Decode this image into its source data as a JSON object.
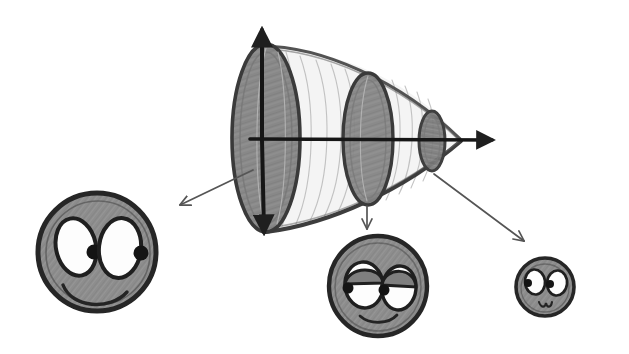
{
  "figure": {
    "background_color": "#ffffff",
    "pencil_dark": "#2b2b2b",
    "pencil_mid": "#6f6f6f",
    "pencil_light": "#b8b8b8",
    "fill_grey": "#858585",
    "fill_grey_dark": "#6a6a6a",
    "eye_white": "#fdfdfd"
  },
  "cone": {
    "name": "cone-with-elliptical-cross-sections",
    "apex": {
      "x": 461,
      "y": 140
    },
    "base_top": {
      "x": 262,
      "y": 44
    },
    "base_bottom": {
      "x": 266,
      "y": 232
    },
    "axes": {
      "vertical_axis": {
        "name": "vertical-axis",
        "x": 262,
        "y_top": 26,
        "y_bottom": 238,
        "arrow_up": true,
        "arrow_down": true
      },
      "horizontal_axis": {
        "name": "horizontal-axis",
        "y": 139,
        "x_left": 250,
        "x_right": 497,
        "arrow_right": true
      }
    },
    "cross_sections": [
      {
        "name": "ellipse-large",
        "cx": 266,
        "cy": 138,
        "rx": 34,
        "ry": 94,
        "shade": "#7b7b7b"
      },
      {
        "name": "ellipse-medium",
        "cx": 368,
        "cy": 139,
        "rx": 25,
        "ry": 66,
        "shade": "#7b7b7b"
      },
      {
        "name": "ellipse-small",
        "cx": 432,
        "cy": 141,
        "rx": 13,
        "ry": 30,
        "shade": "#7b7b7b"
      }
    ],
    "contour_line_count": 9
  },
  "arrows": [
    {
      "name": "arrow-to-large-face",
      "from": {
        "x": 253,
        "y": 170
      },
      "to": {
        "x": 178,
        "y": 207
      },
      "direction": "down-left"
    },
    {
      "name": "arrow-to-middle-face",
      "from": {
        "x": 367,
        "y": 206
      },
      "to": {
        "x": 367,
        "y": 232
      },
      "direction": "down"
    },
    {
      "name": "arrow-to-small-face",
      "from": {
        "x": 434,
        "y": 174
      },
      "to": {
        "x": 527,
        "y": 243
      },
      "direction": "down-right"
    }
  ],
  "faces": [
    {
      "name": "face-large",
      "label": "large-face",
      "cx": 97,
      "cy": 252,
      "rx": 59,
      "ry": 59,
      "expression": "happy-wide-eyes",
      "eyes": [
        {
          "name": "eye-left",
          "cx": 76,
          "cy": 247,
          "rx": 20,
          "ry": 29,
          "rotate": -12,
          "pupil": {
            "cx": 94,
            "cy": 252,
            "r": 7,
            "side": "outer-right"
          }
        },
        {
          "name": "eye-right",
          "cx": 120,
          "cy": 248,
          "rx": 21,
          "ry": 30,
          "rotate": 6,
          "pupil": {
            "cx": 140,
            "cy": 253,
            "r": 7,
            "side": "outer-right"
          }
        }
      ],
      "mouth": {
        "name": "mouth-smile",
        "type": "smile-arc",
        "width": 58,
        "depth": 20
      }
    },
    {
      "name": "face-middle",
      "label": "middle-face",
      "cx": 378,
      "cy": 286,
      "rx": 49,
      "ry": 50,
      "expression": "sleepy-half-lidded",
      "eyes": [
        {
          "name": "eye-left",
          "cx": 364,
          "cy": 285,
          "rx": 18,
          "ry": 22,
          "rotate": -6,
          "pupil": {
            "cx": 348,
            "cy": 288,
            "r": 5,
            "side": "outer-left"
          }
        },
        {
          "name": "eye-right",
          "cx": 399,
          "cy": 287,
          "rx": 16,
          "ry": 21,
          "rotate": 6,
          "pupil": {
            "cx": 384,
            "cy": 290,
            "r": 5,
            "side": "inner-left"
          }
        }
      ],
      "eyelids": true,
      "mouth": {
        "name": "mouth-smile",
        "type": "smile-arc",
        "width": 34,
        "depth": 8
      }
    },
    {
      "name": "face-small",
      "label": "small-face",
      "cx": 545,
      "cy": 287,
      "rx": 29,
      "ry": 29,
      "expression": "curious-small-eyes",
      "eyes": [
        {
          "name": "eye-left",
          "cx": 535,
          "cy": 282,
          "rx": 10,
          "ry": 12,
          "rotate": -6,
          "pupil": {
            "cx": 528,
            "cy": 283,
            "r": 4,
            "side": "inner-left"
          }
        },
        {
          "name": "eye-right",
          "cx": 557,
          "cy": 283,
          "rx": 10,
          "ry": 12,
          "rotate": 6,
          "pupil": {
            "cx": 550,
            "cy": 284,
            "r": 4,
            "side": "inner-left"
          }
        }
      ],
      "mouth": {
        "name": "mouth-smile",
        "type": "small-w-smile",
        "width": 14,
        "depth": 6
      }
    }
  ]
}
